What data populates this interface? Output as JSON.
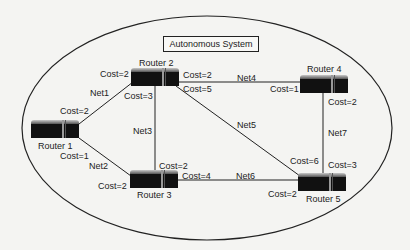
{
  "title": "Autonomous System",
  "colors": {
    "background": "#f4f4f2",
    "line": "#222222",
    "router_body": "#111111"
  },
  "routers": [
    {
      "id": "r1",
      "label": "Router 1"
    },
    {
      "id": "r2",
      "label": "Router 2"
    },
    {
      "id": "r3",
      "label": "Router 3"
    },
    {
      "id": "r4",
      "label": "Router 4"
    },
    {
      "id": "r5",
      "label": "Router 5"
    }
  ],
  "links": [
    {
      "net": "Net1",
      "from": "Router 1",
      "to": "Router 2",
      "cost_from": "Cost=2",
      "cost_to": "Cost=2"
    },
    {
      "net": "Net2",
      "from": "Router 1",
      "to": "Router 3",
      "cost_from": "Cost=1",
      "cost_to": "Cost=2"
    },
    {
      "net": "Net3",
      "from": "Router 2",
      "to": "Router 3",
      "cost_from": "Cost=3",
      "cost_to": "Cost=2"
    },
    {
      "net": "Net4",
      "from": "Router 2",
      "to": "Router 4",
      "cost_from": "Cost=2",
      "cost_to": "Cost=1"
    },
    {
      "net": "Net5",
      "from": "Router 2",
      "to": "Router 5",
      "cost_from": "Cost=5",
      "cost_to": "Cost=6"
    },
    {
      "net": "Net6",
      "from": "Router 3",
      "to": "Router 5",
      "cost_from": "Cost=4",
      "cost_to": "Cost=2"
    },
    {
      "net": "Net7",
      "from": "Router 4",
      "to": "Router 5",
      "cost_from": "Cost=2",
      "cost_to": "Cost=3"
    }
  ]
}
